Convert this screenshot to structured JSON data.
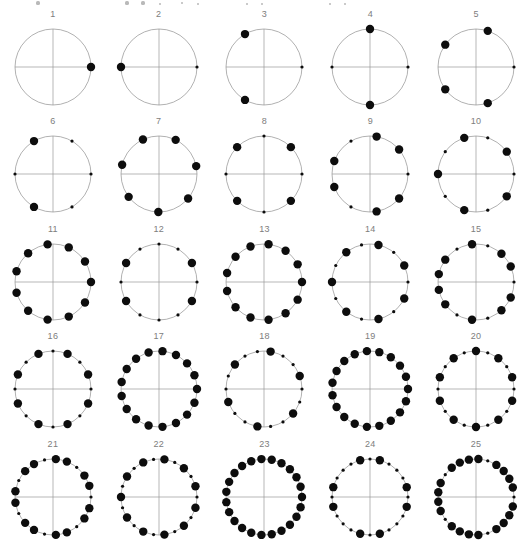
{
  "figure": {
    "title": "",
    "width": 529,
    "height": 546,
    "background_color": "#ffffff",
    "ring_color": "#8f8f8f",
    "axis_color": "#9a9a9a",
    "dot_color": "#0d0d0d",
    "label_color": "#7d7d7d",
    "columns": 5,
    "rows": 5,
    "radius": 38,
    "large_dot_radius": 4.2,
    "small_dot_radius": 1.6
  },
  "top_artifact": {
    "description": "clipped-previous-row",
    "dots": [
      {
        "x": 38,
        "y": 3,
        "r": 1.6
      },
      {
        "x": 127,
        "y": 3,
        "r": 1.6
      },
      {
        "x": 143,
        "y": 3,
        "r": 1.6
      },
      {
        "x": 160,
        "y": 4,
        "r": 1.1
      },
      {
        "x": 182,
        "y": 3,
        "r": 1.3
      },
      {
        "x": 198,
        "y": 4,
        "r": 1.1
      },
      {
        "x": 247,
        "y": 4,
        "r": 1.1
      },
      {
        "x": 262,
        "y": 4,
        "r": 1.0
      },
      {
        "x": 330,
        "y": 4,
        "r": 1.0
      },
      {
        "x": 345,
        "y": 4,
        "r": 1.0
      }
    ]
  },
  "chart_data": {
    "type": "scatter",
    "title": "",
    "xlabel": "",
    "ylabel": "",
    "panels": [
      {
        "label": "1",
        "n": 1,
        "rotation_deg": 0,
        "angles_deg": [
          0
        ],
        "sizes": [
          "large"
        ]
      },
      {
        "label": "2",
        "n": 2,
        "rotation_deg": 0,
        "angles_deg": [
          0,
          180
        ],
        "sizes": [
          "small",
          "large"
        ]
      },
      {
        "label": "3",
        "n": 3,
        "rotation_deg": 0,
        "angles_deg": [
          0,
          120,
          240
        ],
        "sizes": [
          "small",
          "large",
          "large"
        ]
      },
      {
        "label": "4",
        "n": 4,
        "rotation_deg": 0,
        "angles_deg": [
          0,
          90,
          180,
          270
        ],
        "sizes": [
          "small",
          "large",
          "small",
          "large"
        ]
      },
      {
        "label": "5",
        "n": 5,
        "rotation_deg": 0,
        "angles_deg": [
          0,
          72,
          144,
          216,
          288
        ],
        "sizes": [
          "small",
          "large",
          "large",
          "large",
          "large"
        ]
      },
      {
        "label": "6",
        "n": 6,
        "rotation_deg": 0,
        "angles_deg": [
          0,
          60,
          120,
          180,
          240,
          300
        ],
        "sizes": [
          "small",
          "small",
          "large",
          "small",
          "large",
          "small"
        ]
      },
      {
        "label": "7",
        "n": 7,
        "rotation_deg": 64,
        "angles_deg": [
          64,
          115,
          166,
          217,
          269,
          320,
          12
        ],
        "sizes": [
          "large",
          "large",
          "large",
          "large",
          "large",
          "large",
          "large"
        ]
      },
      {
        "label": "8",
        "n": 8,
        "rotation_deg": 0,
        "angles_deg": [
          0,
          45,
          90,
          135,
          180,
          225,
          270,
          315
        ],
        "sizes": [
          "small",
          "large",
          "small",
          "large",
          "small",
          "large",
          "small",
          "large"
        ]
      },
      {
        "label": "9",
        "n": 9,
        "rotation_deg": 0,
        "angles_deg": [
          0,
          40,
          80,
          120,
          160,
          200,
          240,
          280,
          320
        ],
        "sizes": [
          "small",
          "large",
          "large",
          "small",
          "large",
          "large",
          "small",
          "large",
          "large"
        ]
      },
      {
        "label": "10",
        "n": 10,
        "rotation_deg": 0,
        "angles_deg": [
          0,
          36,
          72,
          108,
          144,
          180,
          216,
          252,
          288,
          324
        ],
        "sizes": [
          "small",
          "large",
          "small",
          "large",
          "small",
          "large",
          "small",
          "large",
          "small",
          "large"
        ]
      },
      {
        "label": "11",
        "n": 11,
        "rotation_deg": 0,
        "angles_deg": [
          0,
          32.7,
          65.5,
          98.2,
          130.9,
          163.6,
          196.4,
          229.1,
          261.8,
          294.5,
          327.3
        ],
        "sizes": [
          "large",
          "large",
          "large",
          "large",
          "large",
          "large",
          "large",
          "large",
          "large",
          "large",
          "large"
        ]
      },
      {
        "label": "12",
        "n": 12,
        "rotation_deg": 0,
        "angles_deg": [
          0,
          30,
          60,
          90,
          120,
          150,
          180,
          210,
          240,
          270,
          300,
          330
        ],
        "sizes": [
          "small",
          "large",
          "small",
          "small",
          "small",
          "large",
          "small",
          "large",
          "small",
          "small",
          "small",
          "large"
        ]
      },
      {
        "label": "13",
        "n": 13,
        "rotation_deg": 0,
        "angles_deg": [
          0,
          27.7,
          55.4,
          83.1,
          110.8,
          138.5,
          166.2,
          193.8,
          221.5,
          249.2,
          276.9,
          304.6,
          332.3
        ],
        "sizes": [
          "large",
          "large",
          "large",
          "large",
          "large",
          "large",
          "large",
          "large",
          "large",
          "large",
          "large",
          "large",
          "large"
        ]
      },
      {
        "label": "14",
        "n": 14,
        "rotation_deg": 0,
        "angles_deg": [
          0,
          25.7,
          51.4,
          77.1,
          102.9,
          128.6,
          154.3,
          180,
          205.7,
          231.4,
          257.1,
          282.9,
          308.6,
          334.3
        ],
        "sizes": [
          "small",
          "large",
          "small",
          "large",
          "small",
          "large",
          "small",
          "large",
          "small",
          "large",
          "small",
          "large",
          "small",
          "large"
        ]
      },
      {
        "label": "15",
        "n": 15,
        "rotation_deg": 0,
        "angles_deg": [
          0,
          24,
          48,
          72,
          96,
          120,
          144,
          168,
          192,
          216,
          240,
          264,
          288,
          312,
          336
        ],
        "sizes": [
          "small",
          "large",
          "large",
          "small",
          "large",
          "small",
          "large",
          "large",
          "large",
          "large",
          "small",
          "large",
          "small",
          "large",
          "large"
        ]
      },
      {
        "label": "16",
        "n": 16,
        "rotation_deg": 0,
        "angles_deg": [
          0,
          22.5,
          45,
          67.5,
          90,
          112.5,
          135,
          157.5,
          180,
          202.5,
          225,
          247.5,
          270,
          292.5,
          315,
          337.5
        ],
        "sizes": [
          "small",
          "large",
          "small",
          "large",
          "small",
          "large",
          "small",
          "large",
          "small",
          "large",
          "small",
          "large",
          "small",
          "large",
          "small",
          "large"
        ]
      },
      {
        "label": "17",
        "n": 17,
        "rotation_deg": 0,
        "angles_deg": [
          0,
          21.2,
          42.4,
          63.5,
          84.7,
          105.9,
          127.1,
          148.2,
          169.4,
          190.6,
          211.8,
          232.9,
          254.1,
          275.3,
          296.5,
          317.6,
          338.8
        ],
        "sizes": [
          "large",
          "large",
          "large",
          "large",
          "large",
          "large",
          "large",
          "large",
          "large",
          "large",
          "large",
          "large",
          "large",
          "large",
          "large",
          "large",
          "large"
        ]
      },
      {
        "label": "18",
        "n": 18,
        "rotation_deg": 0,
        "angles_deg": [
          0,
          20,
          40,
          60,
          80,
          100,
          120,
          140,
          160,
          180,
          200,
          220,
          240,
          260,
          280,
          300,
          320,
          340
        ],
        "sizes": [
          "small",
          "large",
          "small",
          "small",
          "large",
          "small",
          "small",
          "large",
          "small",
          "small",
          "large",
          "small",
          "small",
          "large",
          "small",
          "small",
          "large",
          "small"
        ]
      },
      {
        "label": "19",
        "n": 19,
        "rotation_deg": 0,
        "angles_deg": [
          0,
          18.9,
          37.9,
          56.8,
          75.8,
          94.7,
          113.7,
          132.6,
          151.6,
          170.5,
          189.5,
          208.4,
          227.4,
          246.3,
          265.3,
          284.2,
          303.2,
          322.1,
          341.1
        ],
        "sizes": [
          "large",
          "large",
          "large",
          "large",
          "large",
          "large",
          "large",
          "large",
          "large",
          "large",
          "large",
          "large",
          "large",
          "large",
          "large",
          "large",
          "large",
          "large",
          "large"
        ]
      },
      {
        "label": "20",
        "n": 20,
        "rotation_deg": 0,
        "angles_deg": [
          0,
          18,
          36,
          54,
          72,
          90,
          108,
          126,
          144,
          162,
          180,
          198,
          216,
          234,
          252,
          270,
          288,
          306,
          324,
          342
        ],
        "sizes": [
          "small",
          "large",
          "small",
          "large",
          "small",
          "large",
          "small",
          "large",
          "small",
          "large",
          "small",
          "large",
          "small",
          "large",
          "small",
          "large",
          "small",
          "large",
          "small",
          "large"
        ]
      },
      {
        "label": "21",
        "n": 21,
        "rotation_deg": 0,
        "angles_deg": [
          0,
          17.1,
          34.3,
          51.4,
          68.6,
          85.7,
          102.9,
          120,
          137.1,
          154.3,
          171.4,
          188.6,
          205.7,
          222.9,
          240,
          257.1,
          274.3,
          291.4,
          308.6,
          325.7,
          342.9
        ],
        "sizes": [
          "small",
          "large",
          "large",
          "small",
          "large",
          "large",
          "small",
          "large",
          "large",
          "small",
          "large",
          "large",
          "small",
          "large",
          "large",
          "small",
          "large",
          "large",
          "small",
          "large",
          "large"
        ]
      },
      {
        "label": "22",
        "n": 22,
        "rotation_deg": 0,
        "angles_deg": [
          0,
          16.4,
          32.7,
          49.1,
          65.5,
          81.8,
          98.2,
          114.5,
          130.9,
          147.3,
          163.6,
          180,
          196.4,
          212.7,
          229.1,
          245.5,
          261.8,
          278.2,
          294.5,
          310.9,
          327.3,
          343.6
        ],
        "sizes": [
          "small",
          "large",
          "small",
          "large",
          "small",
          "large",
          "small",
          "large",
          "small",
          "large",
          "small",
          "large",
          "small",
          "large",
          "small",
          "large",
          "small",
          "large",
          "small",
          "large",
          "small",
          "large"
        ]
      },
      {
        "label": "23",
        "n": 23,
        "rotation_deg": 0,
        "angles_deg": [
          0,
          15.7,
          31.3,
          47,
          62.6,
          78.3,
          93.9,
          109.6,
          125.2,
          140.9,
          156.5,
          172.2,
          187.8,
          203.5,
          219.1,
          234.8,
          250.4,
          266.1,
          281.7,
          297.4,
          313,
          328.7,
          344.3
        ],
        "sizes": [
          "large",
          "large",
          "large",
          "large",
          "large",
          "large",
          "large",
          "large",
          "large",
          "large",
          "large",
          "large",
          "large",
          "large",
          "large",
          "large",
          "large",
          "large",
          "large",
          "large",
          "large",
          "large",
          "large"
        ]
      },
      {
        "label": "24",
        "n": 24,
        "rotation_deg": 0,
        "angles_deg": [
          0,
          15,
          30,
          45,
          60,
          75,
          90,
          105,
          120,
          135,
          150,
          165,
          180,
          195,
          210,
          225,
          240,
          255,
          270,
          285,
          300,
          315,
          330,
          345
        ],
        "sizes": [
          "small",
          "large",
          "small",
          "small",
          "small",
          "large",
          "small",
          "large",
          "small",
          "small",
          "small",
          "large",
          "small",
          "large",
          "small",
          "small",
          "small",
          "large",
          "small",
          "large",
          "small",
          "small",
          "small",
          "large"
        ]
      },
      {
        "label": "25",
        "n": 25,
        "rotation_deg": 0,
        "angles_deg": [
          0,
          14.4,
          28.8,
          43.2,
          57.6,
          72,
          86.4,
          100.8,
          115.2,
          129.6,
          144,
          158.4,
          172.8,
          187.2,
          201.6,
          216,
          230.4,
          244.8,
          259.2,
          273.6,
          288,
          302.4,
          316.8,
          331.2,
          345.6
        ],
        "sizes": [
          "small",
          "large",
          "large",
          "large",
          "large",
          "small",
          "large",
          "large",
          "large",
          "large",
          "small",
          "large",
          "large",
          "large",
          "large",
          "small",
          "large",
          "large",
          "large",
          "large",
          "small",
          "large",
          "large",
          "large",
          "large"
        ]
      }
    ]
  }
}
